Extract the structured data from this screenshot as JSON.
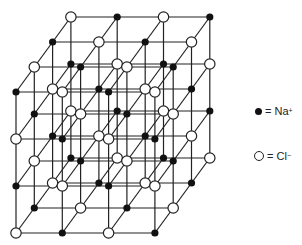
{
  "diagram": {
    "grid_size": 4,
    "origin": [
      16,
      92
    ],
    "step_x": [
      46.3,
      0
    ],
    "step_y": [
      0,
      47
    ],
    "step_depth": [
      18.3,
      -25
    ],
    "line_color": "#222222",
    "line_width": 1.2,
    "na_color": "#111111",
    "cl_fill": "#ffffff",
    "cl_stroke": "#222222",
    "na_radius": 3.6,
    "cl_radius": 5.2,
    "parity_rule": "Na when (i+j+k) even, Cl when odd"
  },
  "legend": {
    "items": [
      {
        "symbol": "filled-circle",
        "text": "= Na",
        "charge": "+",
        "x": 255,
        "y": 105
      },
      {
        "symbol": "open-circle",
        "text": "= Cl",
        "charge": "−",
        "x": 254,
        "y": 150
      }
    ]
  }
}
